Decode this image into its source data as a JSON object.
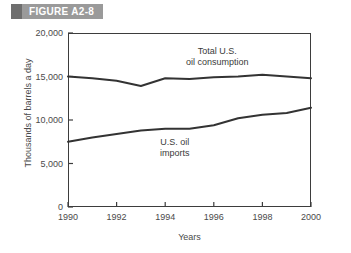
{
  "figure": {
    "banner_label": "FIGURE A2-8"
  },
  "chart_data": {
    "type": "line",
    "title": "",
    "xlabel": "Years",
    "ylabel": "Thousands of barrels a day",
    "xlim": [
      1990,
      2000
    ],
    "ylim": [
      0,
      20000
    ],
    "xticks": [
      "1990",
      "1992",
      "1994",
      "1996",
      "1998",
      "2000"
    ],
    "yticks": [
      "0",
      "5,000",
      "10,000",
      "15,000",
      "20,000"
    ],
    "grid": false,
    "legend_position": "inline-annotations",
    "x": [
      1990,
      1991,
      1992,
      1993,
      1994,
      1995,
      1996,
      1997,
      1998,
      1999,
      2000
    ],
    "series": [
      {
        "name": "Total U.S. oil consumption",
        "annotation": "Total U.S.\noil consumption",
        "annotation_line1": "Total U.S.",
        "annotation_line2": "oil consumption",
        "color": "#333333",
        "values": [
          15000,
          14800,
          14500,
          13900,
          14800,
          14700,
          14900,
          15000,
          15200,
          15000,
          14800
        ]
      },
      {
        "name": "U.S. oil imports",
        "annotation": "U.S. oil\nimports",
        "annotation_line1": "U.S. oil",
        "annotation_line2": "imports",
        "color": "#333333",
        "values": [
          7500,
          8000,
          8400,
          8800,
          9000,
          9000,
          9400,
          10200,
          10600,
          10800,
          11400
        ]
      }
    ]
  }
}
